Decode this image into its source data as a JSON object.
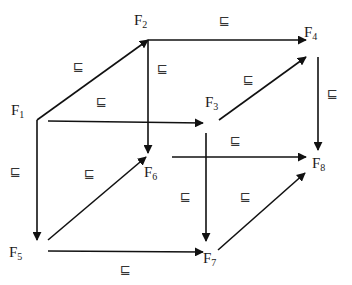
{
  "diagram": {
    "title": "",
    "relation_symbol": "⊑",
    "colors": {
      "line": "#111111",
      "text": "#1a1a1a",
      "background": "#ffffff"
    },
    "nodes": [
      {
        "id": "F1",
        "base": "F",
        "sub": "1",
        "label_pos": [
          11,
          103
        ],
        "point": [
          37,
          120
        ]
      },
      {
        "id": "F2",
        "base": "F",
        "sub": "2",
        "label_pos": [
          134,
          13
        ],
        "point": [
          148,
          40
        ]
      },
      {
        "id": "F3",
        "base": "F",
        "sub": "3",
        "label_pos": [
          205,
          95
        ],
        "point": [
          208,
          123
        ]
      },
      {
        "id": "F4",
        "base": "F",
        "sub": "4",
        "label_pos": [
          304,
          25
        ],
        "point": [
          318,
          52
        ]
      },
      {
        "id": "F5",
        "base": "F",
        "sub": "5",
        "label_pos": [
          9,
          245
        ],
        "point": [
          37,
          240
        ]
      },
      {
        "id": "F6",
        "base": "F",
        "sub": "6",
        "label_pos": [
          144,
          165
        ],
        "point": [
          148,
          155
        ]
      },
      {
        "id": "F7",
        "base": "F",
        "sub": "7",
        "label_pos": [
          203,
          251
        ],
        "point": [
          205,
          253
        ]
      },
      {
        "id": "F8",
        "base": "F",
        "sub": "8",
        "label_pos": [
          312,
          156
        ],
        "point": [
          318,
          157
        ]
      }
    ],
    "edges": [
      {
        "from": "F1",
        "to": "F2",
        "start": [
          37,
          120
        ],
        "end": [
          148,
          40
        ],
        "label": "⊑",
        "label_pos": [
          73,
          60
        ]
      },
      {
        "from": "F2",
        "to": "F4",
        "start": [
          148,
          40
        ],
        "end": [
          306,
          40
        ],
        "label": "⊑",
        "label_pos": [
          219,
          14
        ]
      },
      {
        "from": "F1",
        "to": "F3",
        "start": [
          48,
          121
        ],
        "end": [
          203,
          123
        ],
        "label": "⊑",
        "label_pos": [
          96,
          95
        ]
      },
      {
        "from": "F3",
        "to": "F4",
        "start": [
          219,
          120
        ],
        "end": [
          306,
          57
        ],
        "label": "⊑",
        "label_pos": [
          243,
          73
        ]
      },
      {
        "from": "F2",
        "to": "F6",
        "start": [
          148,
          40
        ],
        "end": [
          148,
          153
        ],
        "label": "⊑",
        "label_pos": [
          157,
          62
        ]
      },
      {
        "from": "F4",
        "to": "F8",
        "start": [
          318,
          57
        ],
        "end": [
          318,
          150
        ],
        "label": "⊑",
        "label_pos": [
          327,
          87
        ]
      },
      {
        "from": "F1",
        "to": "F5",
        "start": [
          37,
          120
        ],
        "end": [
          37,
          240
        ],
        "label": "⊑",
        "label_pos": [
          10,
          165
        ]
      },
      {
        "from": "F3",
        "to": "F7",
        "start": [
          206,
          133
        ],
        "end": [
          206,
          241
        ],
        "label": "⊑",
        "label_pos": [
          180,
          190
        ]
      },
      {
        "from": "F5",
        "to": "F6",
        "start": [
          48,
          240
        ],
        "end": [
          146,
          157
        ],
        "label": "⊑",
        "label_pos": [
          84,
          167
        ]
      },
      {
        "from": "F6",
        "to": "F8",
        "start": [
          172,
          157
        ],
        "end": [
          306,
          157
        ],
        "label": "⊑",
        "label_pos": [
          230,
          134
        ]
      },
      {
        "from": "F5",
        "to": "F7",
        "start": [
          48,
          251
        ],
        "end": [
          203,
          252
        ],
        "label": "⊑",
        "label_pos": [
          120,
          263
        ]
      },
      {
        "from": "F7",
        "to": "F8",
        "start": [
          218,
          250
        ],
        "end": [
          305,
          173
        ],
        "label": "⊑",
        "label_pos": [
          240,
          190
        ]
      }
    ]
  }
}
